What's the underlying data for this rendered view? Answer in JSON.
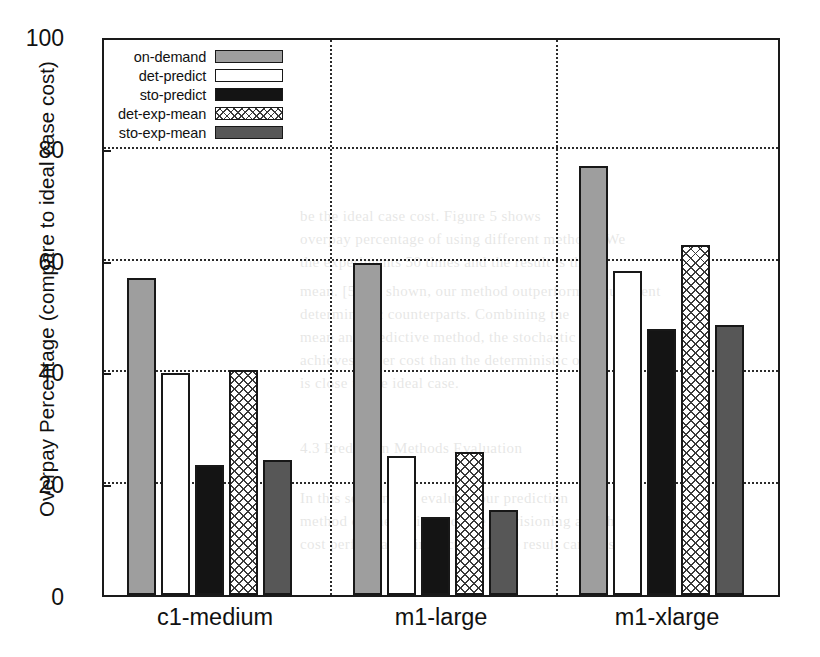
{
  "chart_data": {
    "type": "bar",
    "title": "",
    "xlabel": "",
    "ylabel": "Overpay Percentage (compare to ideal case cost)",
    "categories": [
      "c1-medium",
      "m1-large",
      "m1-xlarge"
    ],
    "ylim": [
      0,
      100
    ],
    "yticks": [
      0,
      20,
      40,
      60,
      80,
      100
    ],
    "ytick_labels": [
      "0",
      "20",
      "40",
      "60",
      "80",
      "100"
    ],
    "grid": "horizontal-dotted-plus-group-separators",
    "legend_position": "upper-left-inside",
    "series": [
      {
        "name": "on-demand",
        "swatch": "sw-on-demand",
        "color": "#9e9e9e",
        "values": [
          56.7,
          59.4,
          76.7
        ]
      },
      {
        "name": "det-predict",
        "swatch": "sw-det-predict",
        "color": "#ffffff",
        "values": [
          39.8,
          24.8,
          58.0
        ]
      },
      {
        "name": "sto-predict",
        "swatch": "sw-sto-predict",
        "color": "#141414",
        "values": [
          23.2,
          14.0,
          47.5
        ]
      },
      {
        "name": "det-exp-mean",
        "swatch": "sw-det-exp-mean",
        "color": "#ffffff",
        "values": [
          40.2,
          25.6,
          62.7
        ]
      },
      {
        "name": "sto-exp-mean",
        "swatch": "sw-sto-exp-mean",
        "color": "#575757",
        "values": [
          24.1,
          15.2,
          48.3
        ]
      }
    ]
  },
  "legend": {
    "items": [
      {
        "label": "on-demand"
      },
      {
        "label": "det-predict"
      },
      {
        "label": "sto-predict"
      },
      {
        "label": "det-exp-mean"
      },
      {
        "label": "sto-exp-mean"
      }
    ]
  },
  "bleed_text": [
    {
      "t": "be the ideal case cost. Figure 5 shows",
      "x": 300,
      "y": 208
    },
    {
      "t": "overpay percentage of using different methods. We",
      "x": 300,
      "y": 231
    },
    {
      "t": "the experiments 50 times and the result is the",
      "x": 300,
      "y": 254
    },
    {
      "t": "mean. [5] As shown, our method outperforms equivalent",
      "x": 300,
      "y": 283
    },
    {
      "t": "deterministic counterparts. Combining the",
      "x": 300,
      "y": 306
    },
    {
      "t": "mean and predictive method, the stochastic",
      "x": 300,
      "y": 329
    },
    {
      "t": "achieves lower cost than the deterministic one",
      "x": 300,
      "y": 352
    },
    {
      "t": "is close to the ideal case.",
      "x": 300,
      "y": 375
    },
    {
      "t": "4.3  Prediction Methods Evaluation",
      "x": 300,
      "y": 440
    },
    {
      "t": "In this section, we evaluate our prediction",
      "x": 300,
      "y": 490
    },
    {
      "t": "method on the basic resource provisioning and the",
      "x": 300,
      "y": 513
    },
    {
      "t": "cost performance in Sect. 4.2. The result can be seen",
      "x": 300,
      "y": 536
    }
  ]
}
